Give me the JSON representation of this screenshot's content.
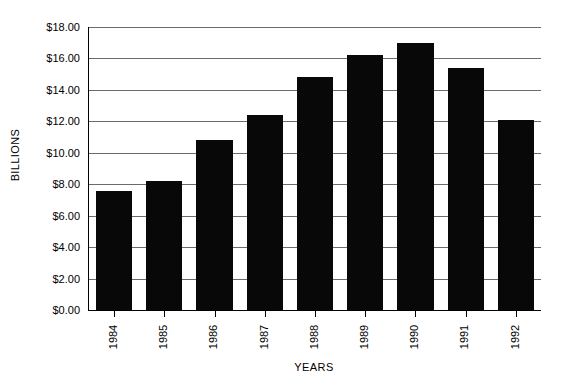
{
  "chart_data": {
    "type": "bar",
    "title": "",
    "subtitle": "",
    "xlabel": "YEARS",
    "ylabel": "BILLIONS",
    "categories": [
      "1984",
      "1985",
      "1986",
      "1987",
      "1988",
      "1989",
      "1990",
      "1991",
      "1992"
    ],
    "values": [
      7.6,
      8.2,
      10.8,
      12.4,
      14.8,
      16.2,
      17.0,
      15.4,
      12.1
    ],
    "series": [
      {
        "name": "Billions",
        "values": [
          7.6,
          8.2,
          10.8,
          12.4,
          14.8,
          16.2,
          17.0,
          15.4,
          12.1
        ]
      }
    ],
    "ylim": [
      0,
      18
    ],
    "ytick_step": 2,
    "ytick_labels": [
      "$0.00",
      "$2.00",
      "$4.00",
      "$6.00",
      "$8.00",
      "$10.00",
      "$12.00",
      "$14.00",
      "$16.00",
      "$18.00"
    ],
    "ytick_values": [
      0,
      2,
      4,
      6,
      8,
      10,
      12,
      14,
      16,
      18
    ],
    "grid": true,
    "grid_axis": "y",
    "legend": false,
    "legend_position": "none",
    "bar_color": "#080808",
    "grid_color": "#6b6b6b",
    "axis_color": "#000000",
    "background_color": "#ffffff",
    "xtick_label_rotation": 90,
    "annotations": []
  }
}
